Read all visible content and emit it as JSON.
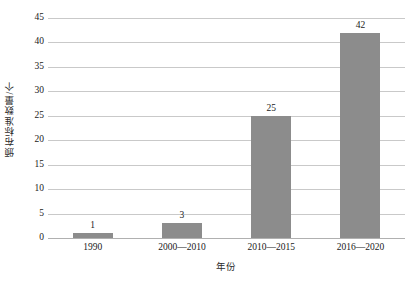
{
  "chart_data": {
    "type": "bar",
    "title": "",
    "subtitle": "",
    "xlabel": "年份",
    "ylabel": "颁布标准数量/个",
    "categories": [
      "1990",
      "2000—2010",
      "2010—2015",
      "2016—2020"
    ],
    "values": [
      1,
      3,
      25,
      42
    ],
    "data_labels": [
      "1",
      "3",
      "25",
      "42"
    ],
    "ylim": [
      0,
      45
    ],
    "ytick_step": 5,
    "yticks": [
      45,
      40,
      35,
      30,
      25,
      20,
      15,
      10,
      5,
      0
    ],
    "ytick_labels": [
      "45",
      "40",
      "35",
      "30",
      "25",
      "20",
      "15",
      "10",
      "5",
      "0"
    ],
    "grid": true,
    "grid_axis": "y",
    "legend": false,
    "legend_position": "none",
    "series": [
      {
        "name": "颁布标准数量/个",
        "values": [
          1,
          3,
          25,
          42
        ]
      }
    ],
    "colors": {
      "bar_fill": "#8c8c8c",
      "gridline": "#c9c9c9",
      "baseline": "#b0b0b0",
      "text": "#1a1a1a",
      "background": "#ffffff"
    }
  }
}
